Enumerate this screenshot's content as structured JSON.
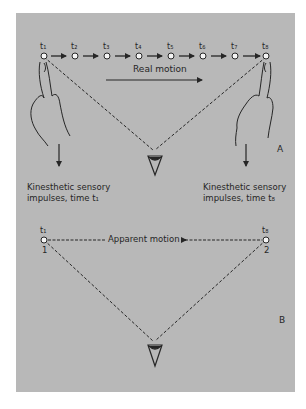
{
  "figure": {
    "panel_a": {
      "letter": "A",
      "time_labels": [
        "t₁",
        "t₂",
        "t₃",
        "t₄",
        "t₅",
        "t₆",
        "t₇",
        "t₈"
      ],
      "motion_label": "Real motion",
      "left_caption_line1": "Kinesthetic sensory",
      "left_caption_line2": "impulses, time t₁",
      "right_caption_line1": "Kinesthetic sensory",
      "right_caption_line2": "impulses, time t₈"
    },
    "panel_b": {
      "letter": "B",
      "left_time": "t₁",
      "right_time": "t₈",
      "left_point": "1",
      "right_point": "2",
      "motion_label": "Apparent motion"
    },
    "colors": {
      "background": "#b8b8b8",
      "ink": "#262626",
      "point_fill": "#f4f4f4"
    }
  }
}
